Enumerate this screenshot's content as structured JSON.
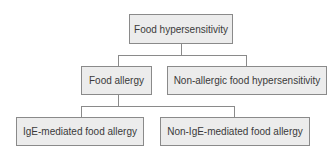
{
  "diagram": {
    "type": "tree",
    "colors": {
      "box_fill": "#ececec",
      "box_border": "#8a8a8a",
      "line": "#8a8a8a",
      "text": "#3a3a3a"
    },
    "nodes": {
      "root": {
        "label": "Food hypersensitivity"
      },
      "food_allergy": {
        "label": "Food allergy"
      },
      "non_allergic": {
        "label": "Non-allergic food hypersensitivity"
      },
      "ige": {
        "label": "IgE-mediated food allergy"
      },
      "non_ige": {
        "label": "Non-IgE-mediated food allergy"
      }
    },
    "edges": [
      {
        "from": "Food hypersensitivity",
        "to": "Food allergy"
      },
      {
        "from": "Food hypersensitivity",
        "to": "Non-allergic food hypersensitivity"
      },
      {
        "from": "Food allergy",
        "to": "IgE-mediated food allergy"
      },
      {
        "from": "Food allergy",
        "to": "Non-IgE-mediated food allergy"
      }
    ]
  }
}
